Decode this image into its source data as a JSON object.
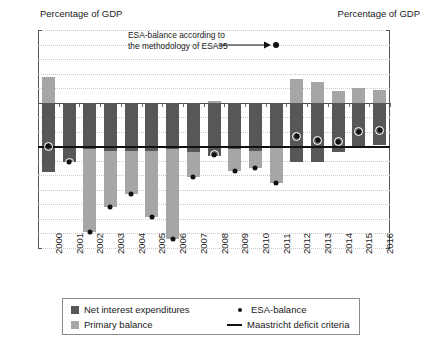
{
  "header": {
    "left_caption": "Percentage of GDP",
    "right_caption": "Percentage of GDP"
  },
  "annotation": {
    "line1": "ESA-balance according to",
    "line2": "the methodology of ESA95",
    "arrow_icon": "arrow-right-icon"
  },
  "legend": {
    "items": [
      {
        "label": "Net interest expenditures",
        "marker": "square",
        "color": "#575757"
      },
      {
        "label": "Primary balance",
        "marker": "square",
        "color": "#a6a6a6"
      },
      {
        "label": "ESA-balance",
        "marker": "dot",
        "color": "#111111"
      },
      {
        "label": "Maastricht deficit criteria",
        "marker": "line",
        "color": "#111111"
      }
    ]
  },
  "chart_data": {
    "type": "bar",
    "title": "",
    "subtitle": "",
    "xlabel": "",
    "ylabel": "Percentage of GDP",
    "ylim": [
      -10,
      5
    ],
    "yticks": [
      5,
      4,
      3,
      2,
      1,
      0,
      -1,
      -2,
      -3,
      -4,
      -5,
      -6,
      -7,
      -8,
      -9,
      -10
    ],
    "ytick_labels": [
      "5",
      "4",
      "3",
      "2",
      "1",
      "0",
      "−1",
      "−2",
      "−3",
      "−4",
      "−5",
      "−6",
      "−7",
      "−8",
      "−9",
      "−10"
    ],
    "grid": true,
    "grid_style": "dotted",
    "legend_position": "bottom",
    "stacked": true,
    "categories": [
      "2000",
      "2001",
      "2002",
      "2003",
      "2004",
      "2005",
      "2006",
      "2007",
      "2008",
      "2009",
      "2010",
      "2011",
      "2012",
      "2013",
      "2014",
      "2015",
      "2016"
    ],
    "series": [
      {
        "name": "Net interest expenditures",
        "color": "#575757",
        "values": [
          -4.8,
          -4.1,
          -3.2,
          -3.3,
          -3.3,
          -3.3,
          -3.2,
          -3.4,
          -3.7,
          -3.2,
          -3.3,
          -3.0,
          -4.1,
          -4.1,
          -3.4,
          -3.1,
          -2.9
        ]
      },
      {
        "name": "Primary balance",
        "color": "#a6a6a6",
        "values": [
          1.8,
          0.0,
          -5.7,
          -3.9,
          -3.0,
          -4.6,
          -6.2,
          -1.7,
          0.1,
          -1.5,
          -1.2,
          -2.5,
          1.6,
          1.4,
          0.8,
          1.0,
          0.9
        ]
      }
    ],
    "overlay_points": {
      "name": "ESA-balance",
      "color": "#111111",
      "values": [
        -3.0,
        -4.1,
        -8.9,
        -7.2,
        -6.3,
        -7.9,
        -9.4,
        -5.1,
        -3.6,
        -4.7,
        -4.5,
        -5.5,
        -2.3,
        -2.6,
        -2.7,
        -2.0,
        -1.9
      ]
    },
    "reference_line": {
      "name": "Maastricht deficit criteria",
      "value": -3.0,
      "color": "#111111"
    },
    "annotation_point": {
      "label": "ESA-balance according to the methodology of ESA95",
      "x_category": "2011",
      "y": 4.0
    }
  }
}
